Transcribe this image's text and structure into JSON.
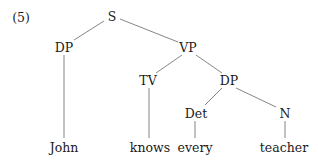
{
  "example_number": "(5)",
  "tree": {
    "nodes": [
      {
        "id": "S",
        "label": "S",
        "x": 112,
        "y": 16
      },
      {
        "id": "DP1",
        "label": "DP",
        "x": 64,
        "y": 47
      },
      {
        "id": "VP",
        "label": "VP",
        "x": 188,
        "y": 47
      },
      {
        "id": "John",
        "label": "John",
        "x": 64,
        "y": 147
      },
      {
        "id": "TV",
        "label": "TV",
        "x": 148,
        "y": 80
      },
      {
        "id": "DP2",
        "label": "DP",
        "x": 229,
        "y": 80
      },
      {
        "id": "knows",
        "label": "knows",
        "x": 150,
        "y": 147
      },
      {
        "id": "Det",
        "label": "Det",
        "x": 196,
        "y": 113
      },
      {
        "id": "N",
        "label": "N",
        "x": 285,
        "y": 113
      },
      {
        "id": "every",
        "label": "every",
        "x": 195,
        "y": 147
      },
      {
        "id": "teacher",
        "label": "teacher",
        "x": 284,
        "y": 147
      }
    ],
    "edges": [
      {
        "from": "S",
        "to": "DP1",
        "x1": 104,
        "y1": 21,
        "x2": 74,
        "y2": 40
      },
      {
        "from": "S",
        "to": "VP",
        "x1": 120,
        "y1": 19,
        "x2": 178,
        "y2": 42
      },
      {
        "from": "DP1",
        "to": "John",
        "x1": 64,
        "y1": 55,
        "x2": 64,
        "y2": 138
      },
      {
        "from": "VP",
        "to": "TV",
        "x1": 182,
        "y1": 55,
        "x2": 156,
        "y2": 73
      },
      {
        "from": "VP",
        "to": "DP2",
        "x1": 196,
        "y1": 55,
        "x2": 222,
        "y2": 73
      },
      {
        "from": "TV",
        "to": "knows",
        "x1": 149,
        "y1": 88,
        "x2": 149,
        "y2": 138
      },
      {
        "from": "DP2",
        "to": "Det",
        "x1": 222,
        "y1": 88,
        "x2": 205,
        "y2": 105
      },
      {
        "from": "DP2",
        "to": "N",
        "x1": 236,
        "y1": 88,
        "x2": 276,
        "y2": 107
      },
      {
        "from": "Det",
        "to": "every",
        "x1": 195,
        "y1": 121,
        "x2": 195,
        "y2": 138
      },
      {
        "from": "N",
        "to": "teacher",
        "x1": 285,
        "y1": 121,
        "x2": 285,
        "y2": 138
      }
    ]
  }
}
